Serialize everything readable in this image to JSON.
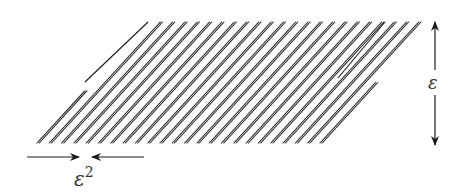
{
  "figure": {
    "strip_count": 24,
    "labels": {
      "height": "ε",
      "gap": "ε",
      "gap_exponent": "2"
    },
    "colors": {
      "ink": "#1a1a1a",
      "text": "#333333",
      "background": "#ffffff"
    }
  }
}
